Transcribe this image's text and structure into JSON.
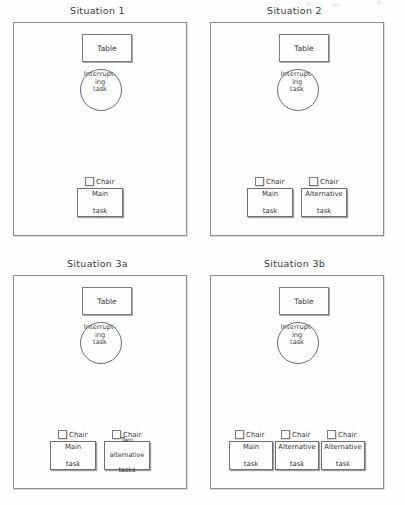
{
  "figure": {
    "kind": "room-layout-diagram",
    "panel_count": 4,
    "labels": {
      "table": "Table",
      "chair": "Chair",
      "interrupting_task_line1": "Interrupt-",
      "interrupting_task_line2": "ing",
      "interrupting_task_line3": "task"
    }
  },
  "panels": [
    {
      "id": "situation-1",
      "title": "Situation 1",
      "table": "Table",
      "circle": {
        "line1": "Interrupt-",
        "line2": "ing",
        "line3": "task"
      },
      "stations": [
        {
          "chair": "Chair",
          "task_lines": [
            "Main",
            "task"
          ]
        }
      ]
    },
    {
      "id": "situation-2",
      "title": "Situation 2",
      "table": "Table",
      "circle": {
        "line1": "Interrupt-",
        "line2": "ing",
        "line3": "task"
      },
      "stations": [
        {
          "chair": "Chair",
          "task_lines": [
            "Main",
            "task"
          ]
        },
        {
          "chair": "Chair",
          "task_lines": [
            "Alternative",
            "task"
          ]
        }
      ]
    },
    {
      "id": "situation-3a",
      "title": "Situation 3a",
      "table": "Table",
      "circle": {
        "line1": "Interrupt-",
        "line2": "ing",
        "line3": "task"
      },
      "stations": [
        {
          "chair": "Chair",
          "task_lines": [
            "Main",
            "task"
          ]
        },
        {
          "chair": "Chair",
          "task_lines": [
            "Two",
            "alternative",
            "tasks"
          ]
        }
      ]
    },
    {
      "id": "situation-3b",
      "title": "Situation 3b",
      "table": "Table",
      "circle": {
        "line1": "Interrupt-",
        "line2": "ing",
        "line3": "task"
      },
      "stations": [
        {
          "chair": "Chair",
          "task_lines": [
            "Main",
            "task"
          ]
        },
        {
          "chair": "Chair",
          "task_lines": [
            "Alternative",
            "task"
          ]
        },
        {
          "chair": "Chair",
          "task_lines": [
            "Alternative",
            "task"
          ]
        }
      ]
    }
  ],
  "colors": {
    "page_background": "#fefefe",
    "ink": "#333333",
    "stroke": "#7d7d7d",
    "shadow": "#a8a8a8"
  }
}
